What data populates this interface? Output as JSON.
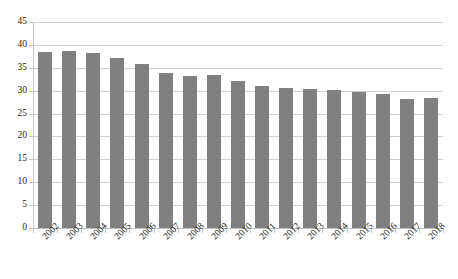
{
  "chart_data": {
    "type": "bar",
    "title": "",
    "subtitle": "",
    "xlabel": "",
    "ylabel": "",
    "categories": [
      "2002",
      "2003",
      "2004",
      "2005",
      "2006",
      "2007",
      "2008",
      "2009",
      "2010",
      "2011",
      "2012",
      "2013",
      "2014",
      "2015",
      "2016",
      "2017",
      "2018"
    ],
    "values": [
      38.5,
      38.6,
      38.2,
      37.1,
      35.9,
      33.9,
      33.2,
      33.5,
      32.1,
      31.0,
      30.6,
      30.3,
      30.2,
      29.8,
      29.3,
      28.1,
      28.4
    ],
    "series": [
      {
        "name": "",
        "values": [
          38.5,
          38.6,
          38.2,
          37.1,
          35.9,
          33.9,
          33.2,
          33.5,
          32.1,
          31.0,
          30.6,
          30.3,
          30.2,
          29.8,
          29.3,
          28.1,
          28.4
        ]
      }
    ],
    "ylim": [
      0,
      45
    ],
    "yticks": [
      0,
      5,
      10,
      15,
      20,
      25,
      30,
      35,
      40,
      45
    ],
    "ytick_labels": [
      "0",
      "5",
      "10",
      "15",
      "20",
      "25",
      "30",
      "35",
      "40",
      "45"
    ],
    "grid": true,
    "grid_axis": "y",
    "legend": false,
    "legend_position": "none",
    "annotations": [],
    "bar_color": "#808080",
    "grid_color": "#d0d0d0",
    "axis_color": "#c8c8c8",
    "background": "#ffffff",
    "xtick_label_rotation": -45
  }
}
